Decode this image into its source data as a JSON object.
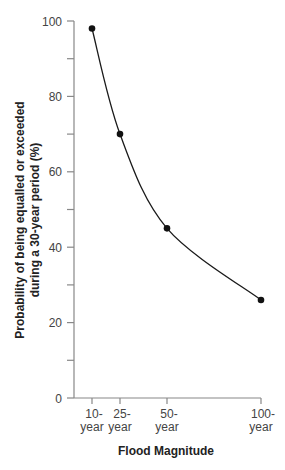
{
  "chart_data": {
    "type": "line",
    "title": "",
    "xlabel": "Flood Magnitude",
    "ylabel_lines": [
      "Probability of being equalled or exceeded",
      "during a 30-year period (%)"
    ],
    "ylabel": "Probability of being equalled or exceeded during a 30-year period (%)",
    "categories": [
      "10-year",
      "25-year",
      "50-year",
      "100-year"
    ],
    "x_tick_labels": [
      [
        "10-",
        "year"
      ],
      [
        "25-",
        "year"
      ],
      [
        "50-",
        "year"
      ],
      [
        "100-",
        "year"
      ]
    ],
    "x": [
      10,
      25,
      50,
      100
    ],
    "values": [
      98,
      70,
      45,
      26
    ],
    "ylim": [
      0,
      100
    ],
    "y_major_ticks": [
      0,
      20,
      40,
      60,
      80,
      100
    ],
    "y_minor_ticks": [
      10,
      30,
      50,
      70,
      90
    ],
    "grid": false,
    "legend": null,
    "markers": true,
    "smooth_curve": true,
    "colors": {
      "line": "#1a1a1a",
      "axis": "#888888",
      "marker": "#111111"
    }
  }
}
